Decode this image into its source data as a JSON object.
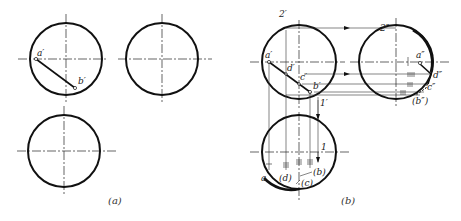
{
  "figure": {
    "panel_a": {
      "caption": "(a)",
      "labels": {
        "a_prime": "a′",
        "b_prime": "b′"
      }
    },
    "panel_b": {
      "caption": "(b)",
      "front_view_labels": {
        "two_prime": "2′",
        "a_prime": "a′",
        "d_prime": "d′",
        "c_prime": "c′",
        "b_prime": "b′",
        "one_prime": "1′"
      },
      "side_view_labels": {
        "two_dprime": "2″",
        "a_dprime": "a″",
        "d_dprime": "d″",
        "c_dprime": "c″",
        "b_dprime": "(b″)"
      },
      "top_view_labels": {
        "one": "1",
        "a": "a",
        "d": "(d)",
        "b": "(b)",
        "c": "(c)"
      }
    }
  }
}
